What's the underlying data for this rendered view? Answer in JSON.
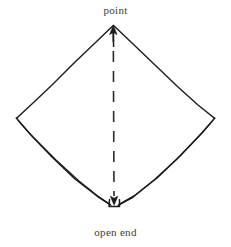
{
  "figure": {
    "title_top_label": "point",
    "title_bottom_label": "open end",
    "background_color": "#ffffff",
    "ink_color": "#1a1a1a",
    "text_color": "#3b3b3b"
  },
  "diagram_data": {
    "type": "line-drawing",
    "subject": "folded napkin diamond",
    "style": "hand-drawn pen and ink illustration",
    "shape": "diamond",
    "vertices": {
      "top": [
        113,
        25
      ],
      "left": [
        16,
        118
      ],
      "right": [
        215,
        118
      ],
      "bottom": [
        114,
        205
      ]
    },
    "labels": [
      {
        "name": "point",
        "text": "point",
        "position": "top",
        "x": 115,
        "y": 12,
        "arrow": {
          "from": [
            114,
            46
          ],
          "to": [
            113,
            26
          ],
          "direction": "up",
          "head": "solid"
        }
      },
      {
        "name": "open end",
        "text": "open end",
        "position": "bottom",
        "x": 115,
        "y": 233,
        "arrow": {
          "from": [
            114,
            180
          ],
          "to": [
            114,
            204
          ],
          "direction": "down",
          "head": "solid"
        }
      }
    ],
    "center_line": {
      "style": "dashed",
      "orientation": "vertical",
      "from": [
        113,
        30
      ],
      "to": [
        114,
        204
      ],
      "dash_pattern": [
        11,
        9
      ]
    },
    "edges": [
      {
        "name": "upper-left-edge",
        "from": [
          113,
          25
        ],
        "to": [
          16,
          118
        ],
        "layers": 1
      },
      {
        "name": "upper-right-edge",
        "from": [
          113,
          25
        ],
        "to": [
          215,
          118
        ],
        "layers": 1
      },
      {
        "name": "lower-left-edge",
        "from": [
          16,
          118
        ],
        "to": [
          114,
          205
        ],
        "layers": 2
      },
      {
        "name": "lower-right-edge",
        "from": [
          215,
          118
        ],
        "to": [
          114,
          205
        ],
        "layers": 2
      }
    ]
  }
}
